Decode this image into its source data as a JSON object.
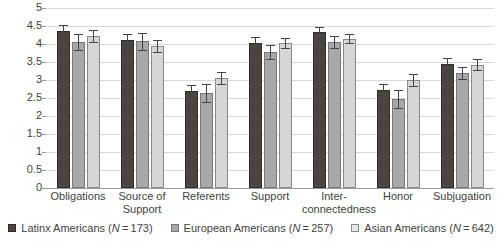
{
  "chart_data": {
    "type": "bar",
    "title": "",
    "subtitle": "",
    "xlabel": "",
    "ylabel": "",
    "ylim": [
      0,
      5
    ],
    "ytick_labels": [
      "0",
      "0.5",
      "1",
      "1.5",
      "2",
      "2.5",
      "3",
      "3.5",
      "4",
      "4.5",
      "5"
    ],
    "ytick_values": [
      0,
      0.5,
      1,
      1.5,
      2,
      2.5,
      3,
      3.5,
      4,
      4.5,
      5
    ],
    "grid": true,
    "legend_position": "bottom",
    "orientation": "vertical",
    "error_bars": "95% CI",
    "categories": [
      "Obligations",
      "Source of Support",
      "Referents",
      "Support",
      "Inter-connectedness",
      "Honor",
      "Subjugation"
    ],
    "category_lines": [
      [
        "Obligations"
      ],
      [
        "Source of",
        "Support"
      ],
      [
        "Referents"
      ],
      [
        "Support"
      ],
      [
        "Inter-",
        "connectedness"
      ],
      [
        "Honor"
      ],
      [
        "Subjugation"
      ]
    ],
    "series": [
      {
        "name": "Latinx Americans",
        "n": 173,
        "color": "#4a4540",
        "values": [
          4.35,
          4.1,
          2.7,
          4.03,
          4.32,
          2.72,
          3.45
        ],
        "err_low": [
          0.17,
          0.17,
          0.17,
          0.17,
          0.15,
          0.17,
          0.17
        ],
        "err_high": [
          0.17,
          0.17,
          0.17,
          0.17,
          0.15,
          0.17,
          0.17
        ]
      },
      {
        "name": "European Americans",
        "n": 257,
        "color": "#a8a8a8",
        "values": [
          4.05,
          4.07,
          2.63,
          3.78,
          4.05,
          2.47,
          3.2
        ],
        "err_low": [
          0.22,
          0.23,
          0.25,
          0.2,
          0.17,
          0.25,
          0.17
        ],
        "err_high": [
          0.22,
          0.23,
          0.25,
          0.2,
          0.17,
          0.25,
          0.17
        ]
      },
      {
        "name": "Asian Americans",
        "n": 642,
        "color": "#d6d6d6",
        "values": [
          4.22,
          3.95,
          3.05,
          4.02,
          4.15,
          3.0,
          3.42
        ],
        "err_low": [
          0.17,
          0.16,
          0.17,
          0.14,
          0.12,
          0.17,
          0.15
        ],
        "err_high": [
          0.17,
          0.16,
          0.17,
          0.14,
          0.12,
          0.17,
          0.15
        ]
      }
    ]
  },
  "legend": {
    "items": [
      {
        "label": "Latinx Americans (N = 173)",
        "swatch": "s0"
      },
      {
        "label": "European Americans (N = 257)",
        "swatch": "s1"
      },
      {
        "label": "Asian Americans (N = 642)",
        "swatch": "s2"
      }
    ]
  }
}
